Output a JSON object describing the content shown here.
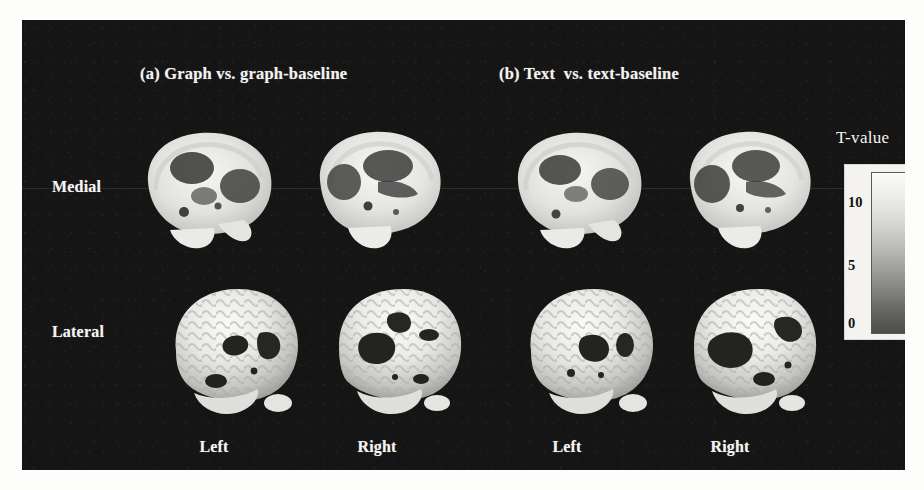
{
  "figure": {
    "background_color": "#ffffff",
    "panel_color": "#151515",
    "panel_titles": [
      {
        "id": "a",
        "label": "(a) Graph vs. graph-baseline"
      },
      {
        "id": "b",
        "label": "(b) Text  vs. text-baseline"
      }
    ],
    "row_labels": [
      {
        "id": "medial",
        "label": "Medial"
      },
      {
        "id": "lateral",
        "label": "Lateral"
      }
    ],
    "column_labels": [
      {
        "id": "col-0",
        "label": "Left"
      },
      {
        "id": "col-1",
        "label": "Right"
      },
      {
        "id": "col-2",
        "label": "Left"
      },
      {
        "id": "col-3",
        "label": "Right"
      }
    ]
  },
  "colorbar": {
    "title": "T-value",
    "ticks": [
      {
        "value": "10",
        "position_pct": 22
      },
      {
        "value": "5",
        "position_pct": 58
      },
      {
        "value": "0",
        "position_pct": 92
      }
    ],
    "high_color": "#fbfbfa",
    "low_color": "#4c4c4b",
    "orientation": "vertical",
    "max_label": "10",
    "min_label": "0"
  },
  "brains": [
    {
      "id": "medial-a-left",
      "row": "Medial",
      "panel": "a",
      "hemisphere": "Left",
      "view": "sagittal-slice"
    },
    {
      "id": "medial-a-right",
      "row": "Medial",
      "panel": "a",
      "hemisphere": "Right",
      "view": "sagittal-slice"
    },
    {
      "id": "medial-b-left",
      "row": "Medial",
      "panel": "b",
      "hemisphere": "Left",
      "view": "sagittal-slice"
    },
    {
      "id": "medial-b-right",
      "row": "Medial",
      "panel": "b",
      "hemisphere": "Right",
      "view": "sagittal-slice"
    },
    {
      "id": "lateral-a-left",
      "row": "Lateral",
      "panel": "a",
      "hemisphere": "Left",
      "view": "surface-render"
    },
    {
      "id": "lateral-a-right",
      "row": "Lateral",
      "panel": "a",
      "hemisphere": "Right",
      "view": "surface-render"
    },
    {
      "id": "lateral-b-left",
      "row": "Lateral",
      "panel": "b",
      "hemisphere": "Left",
      "view": "surface-render"
    },
    {
      "id": "lateral-b-right",
      "row": "Lateral",
      "panel": "b",
      "hemisphere": "Right",
      "view": "surface-render"
    }
  ]
}
